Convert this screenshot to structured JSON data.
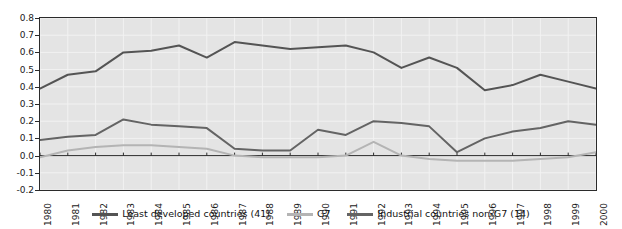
{
  "chart_data": {
    "type": "line",
    "title": "",
    "subtitle": "",
    "xlabel": "",
    "ylabel": "",
    "xlim": [
      1980,
      2000
    ],
    "ylim": [
      -0.2,
      0.8
    ],
    "grid": true,
    "legend_position": "bottom",
    "categories": [
      "1980",
      "1981",
      "1982",
      "1983",
      "1984",
      "1985",
      "1986",
      "1987",
      "1988",
      "1989",
      "1990",
      "1991",
      "1992",
      "1993",
      "1994",
      "1995",
      "1996",
      "1997",
      "1998",
      "1999",
      "2000"
    ],
    "x": [
      1980,
      1981,
      1982,
      1983,
      1984,
      1985,
      1986,
      1987,
      1988,
      1989,
      1990,
      1991,
      1992,
      1993,
      1994,
      1995,
      1996,
      1997,
      1998,
      1999,
      2000
    ],
    "ytick_labels": [
      "0.8",
      "0.7",
      "0.6",
      "0.5",
      "0.4",
      "0.3",
      "0.2",
      "0.1",
      "0.0",
      "-0.1",
      "-0.2"
    ],
    "ytick_values": [
      0.8,
      0.7,
      0.6,
      0.5,
      0.4,
      0.3,
      0.2,
      0.1,
      0.0,
      -0.1,
      -0.2
    ],
    "series": [
      {
        "name": "Least developed countries (41)",
        "color": "#545454",
        "values": [
          0.39,
          0.47,
          0.49,
          0.6,
          0.61,
          0.64,
          0.57,
          0.66,
          0.64,
          0.62,
          0.63,
          0.64,
          0.6,
          0.51,
          0.57,
          0.51,
          0.38,
          0.41,
          0.47,
          0.43,
          0.39
        ]
      },
      {
        "name": "G7",
        "color": "#b4b4b4",
        "values": [
          -0.01,
          0.03,
          0.05,
          0.06,
          0.06,
          0.05,
          0.04,
          0.0,
          -0.01,
          -0.01,
          -0.01,
          0.0,
          0.08,
          0.0,
          -0.02,
          -0.03,
          -0.03,
          -0.03,
          -0.02,
          -0.01,
          0.02
        ]
      },
      {
        "name": "Industrial countries non-G7 (14)",
        "color": "#646464",
        "values": [
          0.09,
          0.11,
          0.12,
          0.21,
          0.18,
          0.17,
          0.16,
          0.04,
          0.03,
          0.03,
          0.15,
          0.12,
          0.2,
          0.19,
          0.17,
          0.02,
          0.1,
          0.14,
          0.16,
          0.2,
          0.18
        ]
      }
    ]
  },
  "legend": {
    "items": [
      {
        "label": "Least developed countries (41)",
        "color": "#545454"
      },
      {
        "label": "G7",
        "color": "#b4b4b4"
      },
      {
        "label": "Industrial countries non-G7 (14)",
        "color": "#646464"
      }
    ]
  }
}
